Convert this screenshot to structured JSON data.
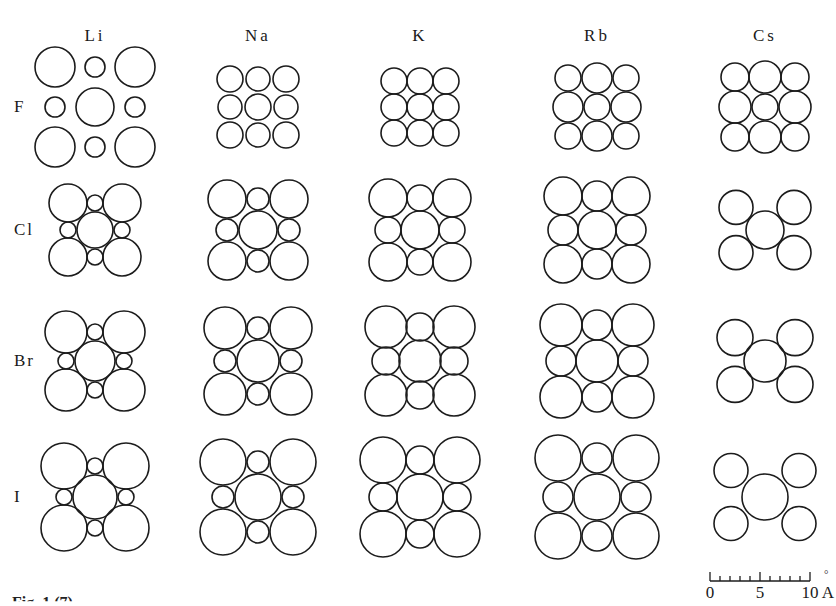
{
  "figure": {
    "columns": [
      {
        "label": "Li",
        "cx": 95
      },
      {
        "label": "Na",
        "cx": 258
      },
      {
        "label": "K",
        "cx": 420
      },
      {
        "label": "Rb",
        "cx": 597
      },
      {
        "label": "Cs",
        "cx": 765
      }
    ],
    "rows": [
      {
        "label": "F",
        "cy": 107
      },
      {
        "label": "Cl",
        "cy": 230
      },
      {
        "label": "Br",
        "cy": 361
      },
      {
        "label": "I",
        "cy": 497
      }
    ],
    "cells": [
      [
        {
          "compound": "LiF",
          "type": "rocksalt",
          "corner_r": 20,
          "edge_r": 10,
          "center_r": 19,
          "step": 40
        },
        {
          "compound": "NaF",
          "type": "rocksalt",
          "corner_r": 13,
          "edge_r": 12,
          "center_r": 13,
          "step": 28
        },
        {
          "compound": "KF",
          "type": "rocksalt",
          "corner_r": 13,
          "edge_r": 13,
          "center_r": 13,
          "step": 26
        },
        {
          "compound": "RbF",
          "type": "rocksalt",
          "corner_r": 13,
          "edge_r": 15,
          "center_r": 13,
          "step": 29
        },
        {
          "compound": "CsF",
          "type": "rocksalt",
          "corner_r": 14,
          "edge_r": 16,
          "center_r": 13,
          "step": 30
        }
      ],
      [
        {
          "compound": "LiCl",
          "type": "rocksalt",
          "corner_r": 19,
          "edge_r": 8,
          "center_r": 18,
          "step": 27
        },
        {
          "compound": "NaCl",
          "type": "rocksalt",
          "corner_r": 19,
          "edge_r": 11,
          "center_r": 19,
          "step": 31
        },
        {
          "compound": "KCl",
          "type": "rocksalt",
          "corner_r": 19,
          "edge_r": 13,
          "center_r": 19,
          "step": 32
        },
        {
          "compound": "RbCl",
          "type": "rocksalt",
          "corner_r": 19,
          "edge_r": 15,
          "center_r": 19,
          "step": 34
        },
        {
          "compound": "CsCl",
          "type": "cscl",
          "corner_r": 17,
          "center_r": 19,
          "step": 29
        }
      ],
      [
        {
          "compound": "LiBr",
          "type": "rocksalt",
          "corner_r": 21,
          "edge_r": 8,
          "center_r": 20,
          "step": 29
        },
        {
          "compound": "NaBr",
          "type": "rocksalt",
          "corner_r": 21,
          "edge_r": 11,
          "center_r": 21,
          "step": 33
        },
        {
          "compound": "KBr",
          "type": "rocksalt",
          "corner_r": 21,
          "edge_r": 14,
          "center_r": 21,
          "step": 34
        },
        {
          "compound": "RbBr",
          "type": "rocksalt",
          "corner_r": 21,
          "edge_r": 15,
          "center_r": 21,
          "step": 36
        },
        {
          "compound": "CsBr",
          "type": "cscl",
          "corner_r": 18,
          "center_r": 21,
          "step": 30
        }
      ],
      [
        {
          "compound": "LiI",
          "type": "rocksalt",
          "corner_r": 23,
          "edge_r": 8,
          "center_r": 22,
          "step": 31
        },
        {
          "compound": "NaI",
          "type": "rocksalt",
          "corner_r": 23,
          "edge_r": 11,
          "center_r": 23,
          "step": 35
        },
        {
          "compound": "KI",
          "type": "rocksalt",
          "corner_r": 23,
          "edge_r": 14,
          "center_r": 23,
          "step": 37
        },
        {
          "compound": "RbI",
          "type": "rocksalt",
          "corner_r": 23,
          "edge_r": 15,
          "center_r": 23,
          "step": 39
        },
        {
          "compound": "CsI",
          "type": "cscl",
          "corner_r": 17,
          "center_r": 23,
          "step": 34
        }
      ]
    ],
    "stroke_color": "#1c1c1c",
    "scale_bar": {
      "ticks": [
        "0",
        "5",
        "10"
      ],
      "unit": "A",
      "unit_ring": "°",
      "minor_divisions": 10
    },
    "caption": "Fig. 1  (7)"
  }
}
